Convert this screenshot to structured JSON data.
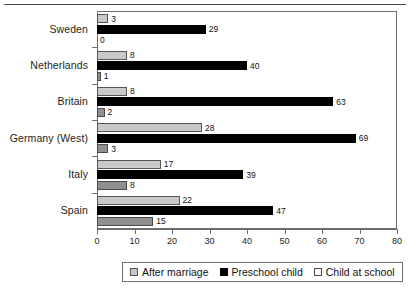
{
  "chart_data": {
    "type": "bar",
    "orientation": "horizontal",
    "title": "",
    "xlabel": "",
    "ylabel": "",
    "xlim": [
      0,
      80
    ],
    "xticks": [
      0,
      10,
      20,
      30,
      40,
      50,
      60,
      70,
      80
    ],
    "grid": false,
    "legend_position": "bottom",
    "categories": [
      "Sweden",
      "Netherlands",
      "Britain",
      "Germany (West)",
      "Italy",
      "Spain"
    ],
    "series": [
      {
        "name": "After marriage",
        "color": "#c9c9c9",
        "values": [
          3,
          8,
          8,
          28,
          17,
          22
        ]
      },
      {
        "name": "Preschool child",
        "color": "#000000",
        "values": [
          29,
          40,
          63,
          69,
          39,
          47
        ]
      },
      {
        "name": "Child at school",
        "color": "#8f8f8f",
        "values": [
          0,
          1,
          2,
          3,
          8,
          15
        ]
      }
    ]
  },
  "axis": {
    "tick_labels": [
      "0",
      "10",
      "20",
      "30",
      "40",
      "50",
      "60",
      "70",
      "80"
    ]
  },
  "legend": {
    "items": [
      {
        "label": "After marriage"
      },
      {
        "label": "Preschool child"
      },
      {
        "label": "Child at school"
      }
    ]
  }
}
